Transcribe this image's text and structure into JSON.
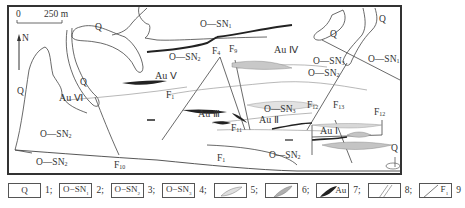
{
  "figure": {
    "type": "geological_map",
    "scale_bar": {
      "start": "0",
      "end": "250 m"
    },
    "north_arrow": "N",
    "unit_labels": [
      {
        "id": "q_top",
        "text": "Q"
      },
      {
        "id": "q_left",
        "text": "Q"
      },
      {
        "id": "q_mid",
        "text": "Q"
      },
      {
        "id": "q_right_upper",
        "text": "Q"
      },
      {
        "id": "q_right_far",
        "text": "Q"
      },
      {
        "id": "q_bottom_right",
        "text": "Q"
      },
      {
        "id": "osn1_top",
        "text": "O—SN",
        "sub": "1"
      },
      {
        "id": "osn1_right",
        "text": "O—SN",
        "sub": "1"
      },
      {
        "id": "osn2_center",
        "text": "O—SN",
        "sub": "2"
      },
      {
        "id": "osn2_right",
        "text": "O—SN",
        "sub": "2"
      },
      {
        "id": "osn2_left",
        "text": "O—SN",
        "sub": "2"
      },
      {
        "id": "osn2_bottom_left",
        "text": "O—SN",
        "sub": "2"
      },
      {
        "id": "osn2_bottom_right",
        "text": "O—SN",
        "sub": "2"
      },
      {
        "id": "osn3_right",
        "text": "O—SN",
        "sub": "3"
      },
      {
        "id": "osn3_center",
        "text": "O—SN",
        "sub": "3"
      }
    ],
    "ore_bodies": [
      "Au Ⅰ",
      "Au Ⅱ",
      "Au Ⅲ",
      "Au Ⅳ",
      "Au Ⅴ",
      "Au Ⅵ"
    ],
    "faults": [
      {
        "text": "F",
        "sub": "1"
      },
      {
        "text": "F",
        "sub": "1"
      },
      {
        "text": "F",
        "sub": "4"
      },
      {
        "text": "F",
        "sub": "9"
      },
      {
        "text": "F",
        "sub": "10"
      },
      {
        "text": "F",
        "sub": "11"
      },
      {
        "text": "F",
        "sub": "12"
      },
      {
        "text": "F",
        "sub": "12"
      },
      {
        "text": "F",
        "sub": "13"
      }
    ]
  },
  "legend": [
    {
      "num": "1;",
      "box_text": "Q"
    },
    {
      "num": "2;",
      "box_text": "O−SN",
      "box_sub": "1"
    },
    {
      "num": "3;",
      "box_text": "O−SN",
      "box_sub": "2"
    },
    {
      "num": "4;",
      "box_text": "O−SN",
      "box_sub": "3"
    },
    {
      "num": "5;",
      "box_text": ""
    },
    {
      "num": "6;",
      "box_text": ""
    },
    {
      "num": "7;",
      "box_text": "Au"
    },
    {
      "num": "8;",
      "box_text": ""
    },
    {
      "num": "9",
      "box_text": "F",
      "box_sub": "1"
    }
  ],
  "colors": {
    "line": "#3a3a3a",
    "frame": "#333333",
    "light_vein": "#d6d6d6",
    "medium_vein": "#b8b8b8",
    "ore": "#222222"
  }
}
